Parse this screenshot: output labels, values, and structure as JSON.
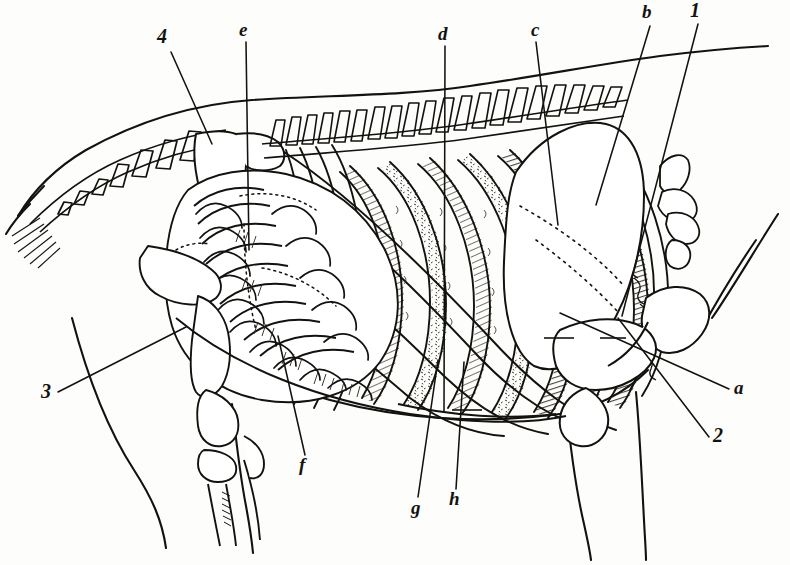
{
  "figure": {
    "kind": "anatomical-engraving",
    "background_color": "#fdfdfb",
    "ink_color": "#14120f",
    "width": 790,
    "height": 565
  },
  "labels": [
    {
      "key": "4",
      "text": "4",
      "style": "num",
      "x": 157,
      "y": 26,
      "size": 20,
      "leader": {
        "x1": 171,
        "y1": 52,
        "x2": 212,
        "y2": 144
      }
    },
    {
      "key": "e",
      "text": "e",
      "style": "italic",
      "x": 239,
      "y": 20,
      "size": 19,
      "leader": {
        "x1": 246,
        "y1": 42,
        "x2": 249,
        "y2": 250
      }
    },
    {
      "key": "d",
      "text": "d",
      "style": "italic",
      "x": 438,
      "y": 24,
      "size": 19,
      "leader": {
        "x1": 445,
        "y1": 46,
        "x2": 444,
        "y2": 412
      }
    },
    {
      "key": "c",
      "text": "c",
      "style": "italic",
      "x": 531,
      "y": 20,
      "size": 19,
      "leader": {
        "x1": 536,
        "y1": 42,
        "x2": 558,
        "y2": 225
      }
    },
    {
      "key": "b",
      "text": "b",
      "style": "italic",
      "x": 642,
      "y": 2,
      "size": 19,
      "leader": {
        "x1": 650,
        "y1": 26,
        "x2": 596,
        "y2": 205
      }
    },
    {
      "key": "1",
      "text": "1",
      "style": "num",
      "x": 690,
      "y": 0,
      "size": 20,
      "leader": {
        "x1": 698,
        "y1": 24,
        "x2": 622,
        "y2": 316
      }
    },
    {
      "key": "a",
      "text": "a",
      "style": "italic",
      "x": 734,
      "y": 378,
      "size": 19,
      "leader": {
        "x1": 729,
        "y1": 389,
        "x2": 560,
        "y2": 313
      }
    },
    {
      "key": "2",
      "text": "2",
      "style": "num",
      "x": 713,
      "y": 425,
      "size": 20,
      "leader": {
        "x1": 709,
        "y1": 437,
        "x2": 618,
        "y2": 318
      }
    },
    {
      "key": "3",
      "text": "3",
      "style": "num",
      "x": 41,
      "y": 381,
      "size": 20,
      "leader": {
        "x1": 58,
        "y1": 392,
        "x2": 186,
        "y2": 327
      }
    },
    {
      "key": "f",
      "text": "f",
      "style": "italic",
      "x": 299,
      "y": 455,
      "size": 19,
      "leader": {
        "x1": 305,
        "y1": 455,
        "x2": 278,
        "y2": 336
      }
    },
    {
      "key": "g",
      "text": "g",
      "style": "italic",
      "x": 411,
      "y": 498,
      "size": 19,
      "leader": {
        "x1": 418,
        "y1": 497,
        "x2": 438,
        "y2": 360
      }
    },
    {
      "key": "h",
      "text": "h",
      "style": "italic",
      "x": 449,
      "y": 489,
      "size": 19,
      "leader": {
        "x1": 456,
        "y1": 489,
        "x2": 464,
        "y2": 362
      }
    }
  ]
}
